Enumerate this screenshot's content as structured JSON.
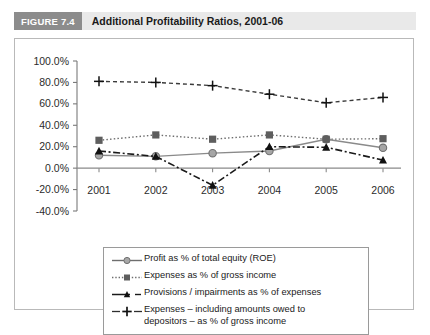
{
  "figure": {
    "badge": "FIGURE 7.4",
    "title": "Additional Profitability Ratios, 2001-06"
  },
  "chart_data": {
    "type": "line",
    "title": "Additional Profitability Ratios, 2001-06",
    "xlabel": "",
    "ylabel": "",
    "categories": [
      "2001",
      "2002",
      "2003",
      "2004",
      "2005",
      "2006"
    ],
    "x": [
      2001,
      2002,
      2003,
      2004,
      2005,
      2006
    ],
    "ylim": [
      -40,
      100
    ],
    "ytick_labels": [
      "100.0%",
      "80.0%",
      "60.0%",
      "40.0%",
      "20.0%",
      "0.0%",
      "-20.0%",
      "-40.0%"
    ],
    "ytick_values": [
      100,
      80,
      60,
      40,
      20,
      0,
      -20,
      -40
    ],
    "grid": false,
    "legend_position": "bottom",
    "series": [
      {
        "name": "Profit as % of total equity (ROE)",
        "marker": "circle",
        "dash": "solid",
        "color": "#8a8a8a",
        "values": [
          12,
          11,
          14,
          16,
          27,
          19
        ]
      },
      {
        "name": "Expenses as % of gross income",
        "marker": "square",
        "dash": "dotted",
        "color": "#6e6e6e",
        "values": [
          26,
          31,
          27,
          31,
          27,
          27.5
        ]
      },
      {
        "name": "Provisions / impairments as % of expenses",
        "marker": "triangle",
        "dash": "dashdot",
        "color": "#1a1a1a",
        "values": [
          16,
          11,
          -16,
          20,
          19.5,
          7.5
        ]
      },
      {
        "name": "Expenses – including amounts owed to depositors – as % of gross income",
        "name_line1": "Expenses – including amounts owed to",
        "name_line2": "depositors – as % of gross income",
        "marker": "plus",
        "dash": "dashed",
        "color": "#3a3a3a",
        "values": [
          81,
          80,
          77,
          69,
          61,
          66
        ]
      }
    ]
  },
  "axis": {
    "y_labels": [
      "100.0%",
      "80.0%",
      "60.0%",
      "40.0%",
      "20.0%",
      "0.0%",
      "-20.0%",
      "-40.0%"
    ],
    "x_labels": [
      "2001",
      "2002",
      "2003",
      "2004",
      "2005",
      "2006"
    ]
  },
  "legend": {
    "items": [
      {
        "label": "Profit as % of total equity (ROE)",
        "key": "circle-solid-key"
      },
      {
        "label": "Expenses as % of gross income",
        "key": "square-dotted-key"
      },
      {
        "label": "Provisions / impairments as % of expenses",
        "key": "triangle-dashdot-key"
      },
      {
        "label_line1": "Expenses – including amounts owed to",
        "label_line2": "depositors – as % of gross income",
        "key": "plus-dashed-key"
      }
    ]
  }
}
